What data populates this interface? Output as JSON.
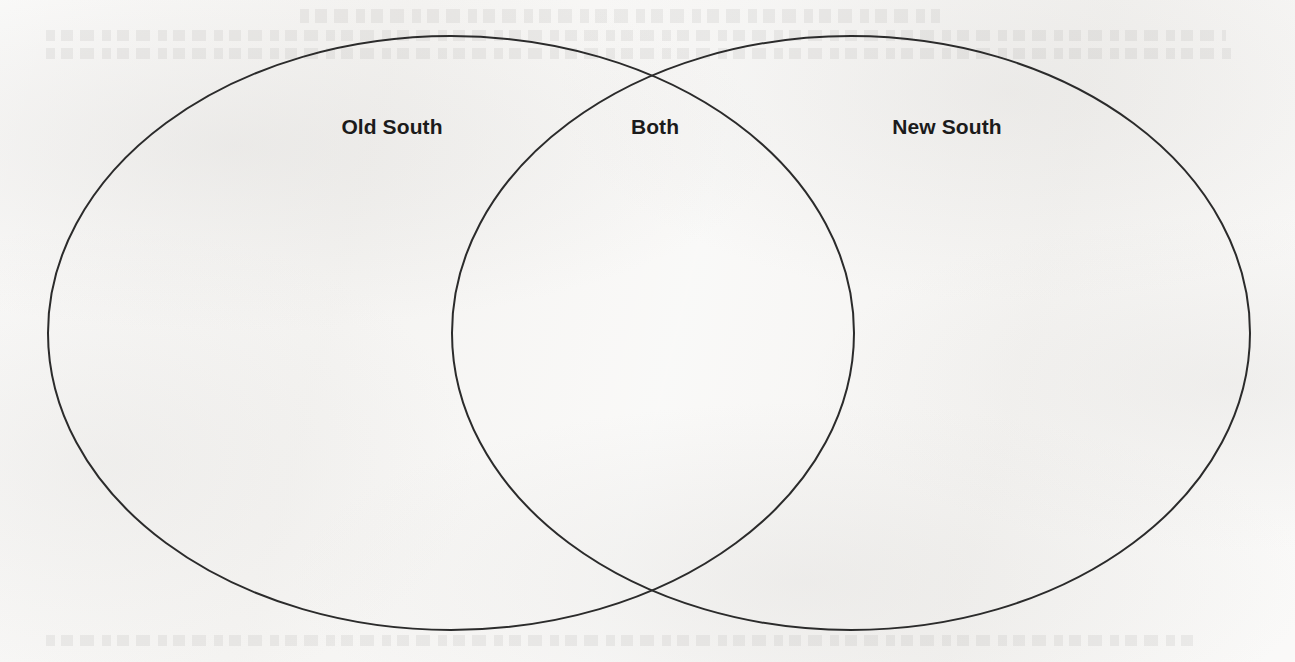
{
  "page": {
    "kind": "venn-diagram-worksheet",
    "background_color": "#f5f4f2",
    "width": 1295,
    "height": 662
  },
  "diagram": {
    "type": "venn",
    "set_count": 2,
    "stroke_color": "#2b2b2b",
    "stroke_width": 2,
    "fill": "none",
    "left_circle": {
      "label": "Old South",
      "cx": 451,
      "cy": 333,
      "rx": 403,
      "ry": 297
    },
    "right_circle": {
      "label": "New South",
      "cx": 851,
      "cy": 333,
      "rx": 399,
      "ry": 297
    },
    "intersection": {
      "label": "Both",
      "top_point": {
        "x": 655,
        "y": 72
      },
      "bottom_point": {
        "x": 655,
        "y": 590
      }
    },
    "labels": [
      {
        "name": "left-region-label",
        "text": "Old South",
        "x": 392,
        "y": 127
      },
      {
        "name": "intersection-region-label",
        "text": "Both",
        "x": 655,
        "y": 127
      },
      {
        "name": "right-region-label",
        "text": "New South",
        "x": 947,
        "y": 127
      }
    ]
  }
}
